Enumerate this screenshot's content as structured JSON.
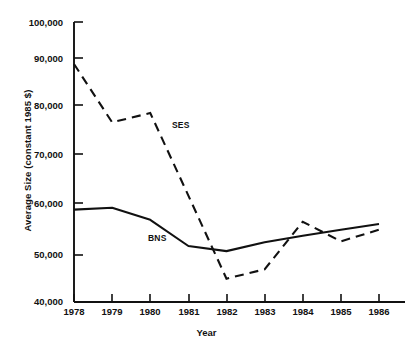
{
  "chart_data": {
    "type": "line",
    "title": "",
    "xlabel": "Year",
    "ylabel": "Average Size (constant 1985 $)",
    "categories": [
      "1978",
      "1979",
      "1980",
      "1981",
      "1982",
      "1983",
      "1984",
      "1985",
      "1986"
    ],
    "x": [
      1978,
      1979,
      1980,
      1981,
      1982,
      1983,
      1984,
      1985,
      1986
    ],
    "xlim": [
      1978,
      1986
    ],
    "ylim": [
      40000,
      100000
    ],
    "ytick_labels": [
      "100,000",
      "90,000",
      "80,000",
      "70,000",
      "60,000",
      "50,000",
      "40,000"
    ],
    "ytick_values": [
      100000,
      90000,
      80000,
      70000,
      60000,
      50000,
      40000
    ],
    "grid": false,
    "legend_position": "inline-annotations",
    "series": [
      {
        "name": "SES",
        "style": "dashed",
        "color": "#111111",
        "values": [
          91000,
          78500,
          80500,
          62800,
          45000,
          47000,
          57200,
          53000,
          55500
        ]
      },
      {
        "name": "BNS",
        "style": "solid",
        "color": "#111111",
        "values": [
          59800,
          60200,
          57600,
          52000,
          50900,
          52800,
          54200,
          55500,
          56700
        ]
      }
    ],
    "annotations": [
      {
        "text": "SES",
        "x": 1980.6,
        "y": 75500
      },
      {
        "text": "BNS",
        "x": 1979.9,
        "y": 54200
      }
    ]
  },
  "figure": {
    "axis_color": "#111111",
    "background": "#ffffff",
    "caption_fragment": ""
  }
}
